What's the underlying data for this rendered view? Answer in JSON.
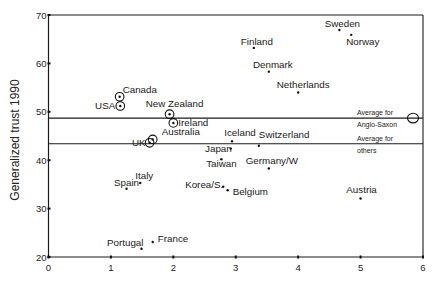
{
  "chart_data": {
    "type": "scatter",
    "title": "",
    "xlabel": "",
    "ylabel": "Generalized trust 1990",
    "xlim": [
      0,
      6
    ],
    "ylim": [
      20,
      70
    ],
    "xticks": [
      "0",
      "1",
      "2",
      "3",
      "4",
      "5",
      "6"
    ],
    "yticks": [
      "20",
      "30",
      "40",
      "50",
      "60",
      "70"
    ],
    "grid": false,
    "legend": "none",
    "points": [
      {
        "name": "Sweden",
        "x": 4.66,
        "y": 66.9,
        "group": "others"
      },
      {
        "name": "Norway",
        "x": 4.85,
        "y": 65.9,
        "group": "others"
      },
      {
        "name": "Finland",
        "x": 3.29,
        "y": 63.2,
        "group": "others"
      },
      {
        "name": "Denmark",
        "x": 3.53,
        "y": 58.3,
        "group": "others"
      },
      {
        "name": "Netherlands",
        "x": 4.0,
        "y": 54.0,
        "group": "others"
      },
      {
        "name": "Canada",
        "x": 1.14,
        "y": 53.1,
        "group": "Anglo-Saxon"
      },
      {
        "name": "USA",
        "x": 1.15,
        "y": 51.2,
        "group": "Anglo-Saxon"
      },
      {
        "name": "New Zealand",
        "x": 1.94,
        "y": 49.5,
        "group": "Anglo-Saxon"
      },
      {
        "name": "Ireland",
        "x": 2.0,
        "y": 47.7,
        "group": "Anglo-Saxon"
      },
      {
        "name": "Australia",
        "x": 1.67,
        "y": 44.3,
        "group": "Anglo-Saxon"
      },
      {
        "name": "UK",
        "x": 1.62,
        "y": 43.6,
        "group": "Anglo-Saxon"
      },
      {
        "name": "Iceland",
        "x": 2.94,
        "y": 43.9,
        "group": "others"
      },
      {
        "name": "Switzerland",
        "x": 3.37,
        "y": 43.0,
        "group": "others"
      },
      {
        "name": "Japan",
        "x": 2.92,
        "y": 42.4,
        "group": "others"
      },
      {
        "name": "Taiwan",
        "x": 2.77,
        "y": 40.2,
        "group": "others"
      },
      {
        "name": "Germany/W",
        "x": 3.53,
        "y": 38.3,
        "group": "others"
      },
      {
        "name": "Korea/S.",
        "x": 2.8,
        "y": 34.5,
        "group": "others"
      },
      {
        "name": "Belgium",
        "x": 2.87,
        "y": 33.8,
        "group": "others"
      },
      {
        "name": "Spain",
        "x": 1.25,
        "y": 34.1,
        "group": "others"
      },
      {
        "name": "Italy",
        "x": 1.47,
        "y": 35.3,
        "group": "others"
      },
      {
        "name": "Austria",
        "x": 5.0,
        "y": 32.1,
        "group": "others"
      },
      {
        "name": "Portugal",
        "x": 1.49,
        "y": 21.7,
        "group": "others"
      },
      {
        "name": "France",
        "x": 1.67,
        "y": 23.1,
        "group": "others"
      }
    ],
    "reference_lines": [
      {
        "id": "anglo-saxon",
        "line1": "Average for",
        "line2": "Anglo-Saxon",
        "y": 48.7
      },
      {
        "id": "others",
        "line1": "Average for",
        "line2": "others",
        "y": 43.4
      }
    ],
    "reference_marker": {
      "x": 5.84,
      "y": 48.7,
      "style": "open-circle"
    }
  }
}
